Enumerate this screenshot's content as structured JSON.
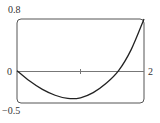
{
  "chart_data": {
    "type": "line",
    "title": "",
    "xlabel": "",
    "ylabel": "",
    "xlim": [
      0,
      2
    ],
    "ylim": [
      -0.5,
      0.8
    ],
    "grid": false,
    "legend": null,
    "tick_labels": {
      "x_left": "0",
      "x_right": "2",
      "y_top": "0.8",
      "y_bottom": "−0.5"
    },
    "x_axis_tick_at": 1,
    "series": [
      {
        "name": "f(x)",
        "x": [
          0,
          0.2,
          0.4,
          0.6,
          0.8,
          1.0,
          1.2,
          1.4,
          1.6,
          1.8,
          2.0
        ],
        "y": [
          0,
          -0.16,
          -0.29,
          -0.38,
          -0.43,
          -0.42,
          -0.34,
          -0.2,
          0.0,
          0.33,
          0.8
        ]
      }
    ]
  },
  "labels": {
    "y_top": "0.8",
    "y_bottom": "−0.5",
    "x_left": "0",
    "x_right": "2"
  }
}
